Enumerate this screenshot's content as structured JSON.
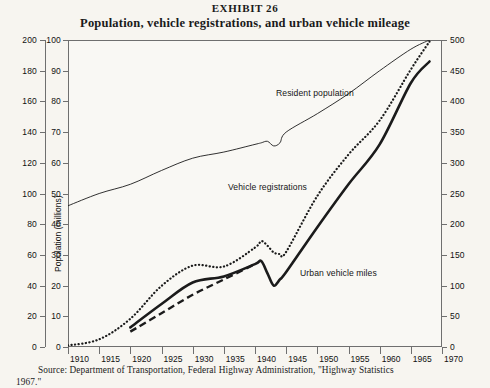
{
  "header": {
    "exhibit": "EXHIBIT 26",
    "title": "Population, vehicle registrations, and urban vehicle mileage"
  },
  "source": {
    "line1": "Source: Department of Transportation, Federal Highway Administration, \"Highway Statistics",
    "line2": "1967.\""
  },
  "axes": {
    "population": {
      "title": "Population (millions)",
      "ticks": [
        "200",
        "180",
        "160",
        "140",
        "120",
        "100",
        "80",
        "60",
        "40",
        "20",
        "0"
      ],
      "min": 0,
      "max": 200
    },
    "registrations": {
      "title": "Registrations (millions)",
      "ticks": [
        "100",
        "90",
        "80",
        "70",
        "60",
        "50",
        "40",
        "30",
        "20",
        "10",
        "0"
      ],
      "min": 0,
      "max": 100
    },
    "urban": {
      "title": "Urban vehicle mileage",
      "ticks": [
        "500",
        "450",
        "400",
        "350",
        "300",
        "250",
        "200",
        "150",
        "100",
        "50",
        "0"
      ],
      "min": 0,
      "max": 500
    },
    "x": {
      "ticks": [
        "1910",
        "1915",
        "1920",
        "1925",
        "1930",
        "1935",
        "1940",
        "1945",
        "1950",
        "1955",
        "1960",
        "1965",
        "1970"
      ],
      "min": 1910,
      "max": 1970
    }
  },
  "series_labels": {
    "population": "Resident population",
    "registrations": "Vehicle registrations",
    "urban": "Urban vehicle miles"
  },
  "chart_data": {
    "type": "line",
    "title": "Population, vehicle registrations, and urban vehicle mileage",
    "subtitle": "EXHIBIT 26",
    "xlabel": "",
    "ylabel": "Population (millions) / Registrations (millions)",
    "y2label": "Urban vehicle mileage",
    "xlim": [
      1910,
      1970
    ],
    "ylim_population": [
      0,
      200
    ],
    "ylim_registrations": [
      0,
      100
    ],
    "ylim_urban": [
      0,
      500
    ],
    "grid": false,
    "legend": "inline-annotations",
    "series": [
      {
        "name": "Resident population",
        "axis": "population",
        "style": "thin-solid",
        "x": [
          1910,
          1915,
          1920,
          1925,
          1930,
          1935,
          1940,
          1941,
          1942,
          1943,
          1944,
          1945,
          1950,
          1955,
          1960,
          1965,
          1968
        ],
        "values": [
          92,
          100,
          106,
          115,
          123,
          127,
          132,
          133,
          134,
          131,
          133,
          140,
          152,
          165,
          180,
          194,
          200
        ]
      },
      {
        "name": "Vehicle registrations",
        "axis": "registrations",
        "style": "dotted",
        "x": [
          1910,
          1915,
          1920,
          1925,
          1930,
          1935,
          1940,
          1941,
          1942,
          1943,
          1944,
          1945,
          1950,
          1955,
          1960,
          1965,
          1968
        ],
        "values": [
          0.5,
          2.5,
          9.2,
          19.9,
          26.5,
          26.2,
          32.4,
          34.5,
          33.0,
          30.8,
          30.3,
          31.0,
          49.2,
          62.7,
          73.8,
          90.4,
          99.5
        ]
      },
      {
        "name": "Urban vehicle miles",
        "axis": "urban",
        "style": "thick-solid",
        "x": [
          1920,
          1925,
          1930,
          1935,
          1940,
          1941,
          1942,
          1943,
          1944,
          1945,
          1950,
          1955,
          1960,
          1965,
          1968
        ],
        "values": [
          32,
          70,
          105,
          115,
          135,
          140,
          120,
          100,
          110,
          122,
          195,
          265,
          330,
          430,
          465
        ]
      },
      {
        "name": "Urban vehicle miles (estimated)",
        "axis": "urban",
        "style": "dashed",
        "x": [
          1920,
          1925,
          1930,
          1935,
          1940
        ],
        "values": [
          25,
          55,
          85,
          110,
          135
        ]
      }
    ]
  }
}
